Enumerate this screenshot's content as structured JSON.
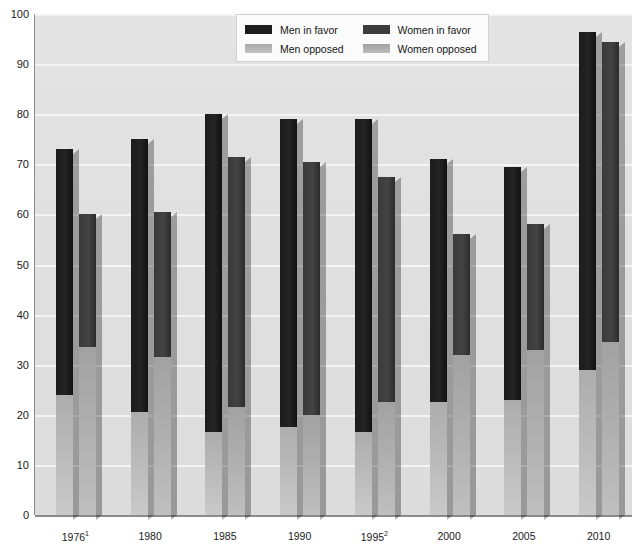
{
  "chart_data": {
    "type": "bar",
    "title": "",
    "subtitle": "",
    "xlabel": "",
    "ylabel": "",
    "ylim": [
      0,
      100
    ],
    "ytick_step": 10,
    "yticks": [
      "0",
      "10",
      "20",
      "30",
      "40",
      "50",
      "60",
      "70",
      "80",
      "90",
      "100"
    ],
    "grid": true,
    "stacked": true,
    "legend_position": "top-center",
    "categories": [
      "1976¹",
      "1980",
      "1985",
      "1990",
      "1995²",
      "2000",
      "2005",
      "2010"
    ],
    "series": [
      {
        "name": "Men in favor",
        "values": [
          73,
          75,
          80,
          79,
          79,
          71,
          69.5,
          96.5
        ]
      },
      {
        "name": "Men opposed",
        "values": [
          24,
          20.5,
          16.5,
          17.5,
          16.5,
          22.5,
          23,
          29
        ]
      },
      {
        "name": "Women in favor",
        "values": [
          60,
          60.5,
          71.5,
          70.5,
          67.5,
          56,
          58,
          94.5
        ]
      },
      {
        "name": "Women opposed",
        "values": [
          33.5,
          31.5,
          21.5,
          20,
          22.5,
          32,
          33,
          34.5
        ]
      }
    ],
    "colors": {
      "men_favor": "#1c1c1c",
      "men_opposed": "#b9b9b9",
      "women_favor": "#3c3c3c",
      "women_opposed": "#aeaeae",
      "plot_background": "#e0e0e0",
      "gridline": "#f4f4f4",
      "axis": "#8b8b8b"
    }
  },
  "legend": {
    "items": [
      {
        "label": "Men in favor",
        "swatch": "sw-men-favor"
      },
      {
        "label": "Women in favor",
        "swatch": "sw-women-favor"
      },
      {
        "label": "Men opposed",
        "swatch": "sw-men-opp"
      },
      {
        "label": "Women opposed",
        "swatch": "sw-women-opp"
      }
    ]
  }
}
